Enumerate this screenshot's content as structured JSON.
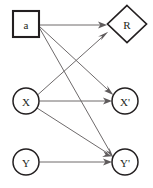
{
  "diagram": {
    "background_color": "#ffffff",
    "node_stroke_color": "#231f20",
    "edge_color": "#6e6a6b",
    "nodes": [
      {
        "id": "a",
        "label": "a",
        "shape": "square",
        "cx": 26,
        "cy": 24,
        "w": 26,
        "h": 26
      },
      {
        "id": "R",
        "label": "R",
        "shape": "diamond",
        "cx": 127,
        "cy": 24,
        "w": 38,
        "h": 37
      },
      {
        "id": "X",
        "label": "X",
        "shape": "circle",
        "cx": 26,
        "cy": 101,
        "r": 13
      },
      {
        "id": "Xp",
        "label": "X'",
        "shape": "circle",
        "cx": 125,
        "cy": 101,
        "r": 13
      },
      {
        "id": "Y",
        "label": "Y",
        "shape": "circle",
        "cx": 26,
        "cy": 162,
        "r": 13
      },
      {
        "id": "Yp",
        "label": "Y'",
        "shape": "circle",
        "cx": 125,
        "cy": 162,
        "r": 13
      }
    ],
    "edges": [
      {
        "id": "a-to-R",
        "from": "a",
        "to": "R",
        "x1": 39.5,
        "y1": 25,
        "x2": 106,
        "y2": 25
      },
      {
        "id": "a-to-Xp",
        "from": "a",
        "to": "Xp",
        "x1": 39.5,
        "y1": 26.5,
        "x2": 113,
        "y2": 94
      },
      {
        "id": "a-to-Yp",
        "from": "a",
        "to": "Yp",
        "x1": 39.5,
        "y1": 28,
        "x2": 113.5,
        "y2": 154
      },
      {
        "id": "X-to-R",
        "from": "X",
        "to": "R",
        "x1": 37.5,
        "y1": 95,
        "x2": 108,
        "y2": 32
      },
      {
        "id": "X-to-Xp",
        "from": "X",
        "to": "Xp",
        "x1": 39.5,
        "y1": 101,
        "x2": 111,
        "y2": 101
      },
      {
        "id": "X-to-Yp",
        "from": "X",
        "to": "Yp",
        "x1": 37,
        "y1": 108,
        "x2": 112,
        "y2": 156
      },
      {
        "id": "Y-to-Yp",
        "from": "Y",
        "to": "Yp",
        "x1": 39.5,
        "y1": 162,
        "x2": 111,
        "y2": 162
      }
    ]
  }
}
